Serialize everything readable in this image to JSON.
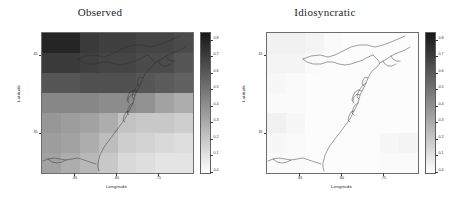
{
  "figure": {
    "panels": [
      {
        "key": "observed",
        "title": "Observed",
        "xlabel": "Longitude",
        "ylabel": "Latitude"
      },
      {
        "key": "idiosyncratic",
        "title": "Idiosyncratic",
        "xlabel": "Longitude",
        "ylabel": "Latitude"
      }
    ],
    "axes": {
      "xticks": [
        "-85",
        "-80",
        "-75"
      ],
      "xtick_values": [
        -85,
        -80,
        -75
      ],
      "yticks": [
        "45",
        "35"
      ],
      "ytick_values": [
        45,
        35
      ],
      "xlim": [
        -89,
        -71
      ],
      "ylim": [
        30,
        48
      ]
    },
    "colorbar": {
      "ticks": [
        "0.8",
        "0.7",
        "0.6",
        "0.5",
        "0.4",
        "0.3",
        "0.2",
        "0.1",
        "0.0"
      ],
      "tick_values": [
        0.8,
        0.7,
        0.6,
        0.5,
        0.4,
        0.3,
        0.2,
        0.1,
        0.0
      ],
      "vmin": 0.0,
      "vmax": 0.85,
      "colormap": "grayscale-reversed",
      "low_color": "#ffffff",
      "high_color": "#1a1a1a"
    }
  },
  "chart_data": [
    {
      "type": "heatmap",
      "title": "Observed",
      "xlabel": "Longitude",
      "ylabel": "Latitude",
      "colorbar_label": "",
      "vmin": 0.0,
      "vmax": 0.85,
      "colormap": "grayscale-reversed",
      "grid": false,
      "legend_position": "right",
      "x": [
        -88,
        -86,
        -84,
        -82,
        -80,
        -78,
        -76,
        -74
      ],
      "y": [
        47,
        44,
        41,
        38,
        35,
        33,
        31
      ],
      "xlim": [
        -89,
        -71
      ],
      "ylim": [
        30,
        48
      ],
      "xtick_labels": [
        "-85",
        "-80",
        "-75"
      ],
      "ytick_labels": [
        "45",
        "35"
      ],
      "values": [
        [
          0.8,
          0.8,
          0.72,
          0.7,
          0.7,
          0.68,
          0.68,
          0.66
        ],
        [
          0.72,
          0.72,
          0.7,
          0.68,
          0.68,
          0.66,
          0.66,
          0.62
        ],
        [
          0.62,
          0.62,
          0.64,
          0.64,
          0.64,
          0.62,
          0.6,
          0.58
        ],
        [
          0.44,
          0.44,
          0.44,
          0.42,
          0.42,
          0.4,
          0.34,
          0.3
        ],
        [
          0.38,
          0.36,
          0.34,
          0.3,
          0.22,
          0.2,
          0.2,
          0.18
        ],
        [
          0.36,
          0.34,
          0.3,
          0.24,
          0.18,
          0.16,
          0.14,
          0.12
        ],
        [
          0.34,
          0.3,
          0.26,
          0.2,
          0.14,
          0.12,
          0.1,
          0.1
        ]
      ]
    },
    {
      "type": "heatmap",
      "title": "Idiosyncratic",
      "xlabel": "Longitude",
      "ylabel": "Latitude",
      "colorbar_label": "",
      "vmin": 0.0,
      "vmax": 0.85,
      "colormap": "grayscale-reversed",
      "grid": false,
      "legend_position": "right",
      "x": [
        -88,
        -86,
        -84,
        -82,
        -80,
        -78,
        -76,
        -74
      ],
      "y": [
        47,
        44,
        41,
        38,
        35,
        33,
        31
      ],
      "xlim": [
        -89,
        -71
      ],
      "ylim": [
        30,
        48
      ],
      "xtick_labels": [
        "-85",
        "-80",
        "-75"
      ],
      "ytick_labels": [
        "45",
        "35"
      ],
      "values": [
        [
          0.05,
          0.05,
          0.04,
          0.02,
          0.01,
          0.01,
          0.01,
          0.01
        ],
        [
          0.04,
          0.04,
          0.02,
          0.01,
          0.01,
          0.01,
          0.01,
          0.01
        ],
        [
          0.03,
          0.02,
          0.01,
          0.01,
          0.01,
          0.01,
          0.01,
          0.01
        ],
        [
          0.02,
          0.02,
          0.01,
          0.01,
          0.01,
          0.01,
          0.01,
          0.01
        ],
        [
          0.05,
          0.03,
          0.01,
          0.01,
          0.01,
          0.01,
          0.01,
          0.01
        ],
        [
          0.03,
          0.02,
          0.01,
          0.01,
          0.01,
          0.01,
          0.03,
          0.04
        ],
        [
          0.02,
          0.02,
          0.01,
          0.01,
          0.01,
          0.01,
          0.02,
          0.02
        ]
      ]
    }
  ]
}
